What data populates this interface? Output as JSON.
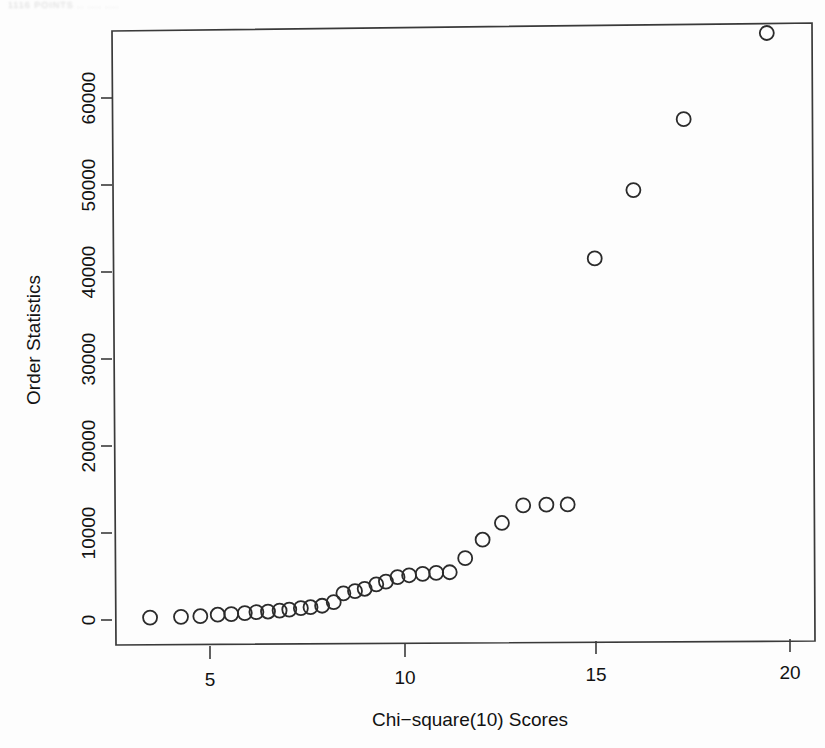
{
  "page": {
    "header_artifact_text": "1116  POINTS  ..  .... ....",
    "background_color": "#fdfdfd",
    "foreground_color": "#2b2b2b"
  },
  "chart_data": {
    "type": "scatter",
    "title": "",
    "subtitle": "",
    "xlabel": "Chi−square(10) Scores",
    "ylabel": "Order Statistics",
    "xlim": [
      3.0,
      20.3
    ],
    "ylim": [
      -2000,
      68500
    ],
    "xticks": [
      5,
      10,
      15,
      20
    ],
    "xtick_labels": [
      "5",
      "10",
      "15",
      "20"
    ],
    "yticks": [
      0,
      10000,
      20000,
      30000,
      40000,
      50000,
      60000
    ],
    "ytick_labels": [
      "0",
      "10000",
      "20000",
      "30000",
      "40000",
      "50000",
      "60000"
    ],
    "grid": false,
    "legend": null,
    "marker": "open-circle",
    "marker_size": 7,
    "series": [
      {
        "name": "Order statistics vs Chi-square(10) quantiles",
        "x": [
          3.45,
          4.25,
          4.75,
          5.2,
          5.55,
          5.9,
          6.2,
          6.5,
          6.8,
          7.05,
          7.35,
          7.6,
          7.9,
          8.2,
          8.45,
          8.75,
          9.0,
          9.3,
          9.55,
          9.85,
          10.15,
          10.5,
          10.85,
          11.2,
          11.6,
          12.05,
          12.55,
          13.1,
          13.7,
          14.25,
          14.95,
          15.95,
          17.25,
          19.4
        ],
        "y": [
          350,
          400,
          450,
          600,
          650,
          750,
          850,
          900,
          1000,
          1100,
          1250,
          1350,
          1500,
          1900,
          2900,
          3150,
          3400,
          3900,
          4200,
          4700,
          4900,
          5050,
          5150,
          5200,
          6800,
          8900,
          10800,
          12800,
          12850,
          12850,
          41100,
          48900,
          57000,
          66800
        ]
      }
    ]
  }
}
